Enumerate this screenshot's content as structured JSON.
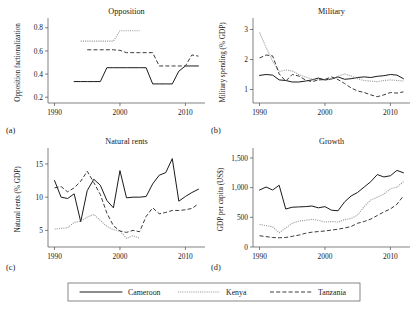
{
  "figure": {
    "background": "#ffffff",
    "series_colors": {
      "cameroon": "#1a1a1a",
      "kenya": "#9a9a9a",
      "tanzania": "#3a3a3a"
    },
    "panel_letters": {
      "a": "(a)",
      "b": "(b)",
      "c": "(c)",
      "d": "(d)"
    }
  },
  "legend": {
    "position": "bottom-center",
    "entries": [
      {
        "label": "Cameroon",
        "style": "solid",
        "color": "#1a1a1a"
      },
      {
        "label": "Kenya",
        "style": "dotted",
        "color": "#9a9a9a"
      },
      {
        "label": "Tanzania",
        "style": "dashed",
        "color": "#3a3a3a"
      }
    ]
  },
  "chart_data": [
    {
      "type": "line",
      "panel": "(a)",
      "title": "Opposition",
      "xlabel": "",
      "ylabel": "Opposition factionalization",
      "xlim": [
        1989,
        2013
      ],
      "ylim": [
        0.15,
        0.85
      ],
      "xticks": [
        1990,
        2000,
        2010
      ],
      "xticklabels": [
        "1990",
        "2000",
        "2010"
      ],
      "yticks": [
        0.2,
        0.4,
        0.6,
        0.8
      ],
      "yticklabels": [
        "0.2",
        "0.4",
        "0.6",
        "0.8"
      ],
      "grid": false,
      "x": [
        1990,
        1991,
        1992,
        1993,
        1994,
        1995,
        1996,
        1997,
        1998,
        1999,
        2000,
        2001,
        2002,
        2003,
        2004,
        2005,
        2006,
        2007,
        2008,
        2009,
        2010,
        2011,
        2012
      ],
      "series": [
        {
          "name": "Cameroon",
          "values": [
            null,
            null,
            null,
            0.335,
            0.335,
            0.335,
            0.335,
            0.335,
            0.455,
            0.455,
            0.455,
            0.455,
            0.455,
            0.455,
            0.455,
            0.315,
            0.315,
            0.315,
            0.315,
            0.425,
            0.47,
            0.47,
            0.47
          ]
        },
        {
          "name": "Kenya",
          "values": [
            null,
            null,
            null,
            null,
            0.685,
            0.685,
            0.685,
            0.685,
            0.685,
            0.685,
            0.775,
            0.775,
            0.775,
            0.775,
            null,
            null,
            null,
            null,
            null,
            null,
            null,
            null,
            null
          ]
        },
        {
          "name": "Tanzania",
          "values": [
            null,
            null,
            null,
            null,
            null,
            0.61,
            0.61,
            0.61,
            0.61,
            0.61,
            0.605,
            0.585,
            0.585,
            0.585,
            0.585,
            0.585,
            0.47,
            0.47,
            0.47,
            0.47,
            0.47,
            0.565,
            0.555
          ]
        }
      ]
    },
    {
      "type": "line",
      "panel": "(b)",
      "title": "Military",
      "xlabel": "",
      "ylabel": "Military spending (% GDP)",
      "xlim": [
        1989,
        2013
      ],
      "ylim": [
        0.55,
        3.25
      ],
      "xticks": [
        1990,
        2000,
        2010
      ],
      "xticklabels": [
        "1990",
        "2000",
        "2010"
      ],
      "yticks": [
        1,
        2,
        3
      ],
      "yticklabels": [
        "1",
        "2",
        "3"
      ],
      "grid": false,
      "x": [
        1990,
        1991,
        1992,
        1993,
        1994,
        1995,
        1996,
        1997,
        1998,
        1999,
        2000,
        2001,
        2002,
        2003,
        2004,
        2005,
        2006,
        2007,
        2008,
        2009,
        2010,
        2011,
        2012
      ],
      "series": [
        {
          "name": "Cameroon",
          "values": [
            1.47,
            1.5,
            1.48,
            1.32,
            1.3,
            1.25,
            1.25,
            1.28,
            1.32,
            1.38,
            1.32,
            1.35,
            1.42,
            1.34,
            1.36,
            1.4,
            1.42,
            1.4,
            1.44,
            1.46,
            1.5,
            1.48,
            1.36
          ]
        },
        {
          "name": "Kenya",
          "values": [
            2.9,
            2.4,
            1.95,
            1.6,
            1.65,
            1.62,
            1.5,
            1.42,
            1.35,
            1.32,
            1.3,
            1.36,
            1.44,
            1.52,
            1.45,
            1.36,
            1.3,
            1.28,
            1.26,
            1.3,
            1.32,
            1.3,
            1.28
          ]
        },
        {
          "name": "Tanzania",
          "values": [
            2.05,
            2.15,
            2.12,
            1.52,
            1.28,
            1.5,
            1.45,
            1.32,
            1.26,
            1.32,
            1.34,
            1.42,
            1.33,
            1.2,
            1.05,
            0.95,
            0.9,
            0.82,
            0.76,
            0.82,
            0.9,
            0.88,
            0.92
          ]
        }
      ]
    },
    {
      "type": "line",
      "panel": "(c)",
      "title": "Natural rents",
      "xlabel": "",
      "ylabel": "Natural rents (% GDP)",
      "xlim": [
        1989,
        2013
      ],
      "ylim": [
        2.5,
        16.8
      ],
      "xticks": [
        1990,
        2000,
        2010
      ],
      "xticklabels": [
        "1990",
        "2000",
        "2010"
      ],
      "yticks": [
        5,
        10,
        15
      ],
      "yticklabels": [
        "5",
        "10",
        "15"
      ],
      "grid": false,
      "x": [
        1990,
        1991,
        1992,
        1993,
        1994,
        1995,
        1996,
        1997,
        1998,
        1999,
        2000,
        2001,
        2002,
        2003,
        2004,
        2005,
        2006,
        2007,
        2008,
        2009,
        2010,
        2011,
        2012
      ],
      "series": [
        {
          "name": "Cameroon",
          "values": [
            12.5,
            10.0,
            9.8,
            10.5,
            6.3,
            11.0,
            12.7,
            11.8,
            9.5,
            8.4,
            14.0,
            9.9,
            10.0,
            10.0,
            10.1,
            12.0,
            13.3,
            13.7,
            15.8,
            9.4,
            10.1,
            10.7,
            11.2
          ]
        },
        {
          "name": "Kenya",
          "values": [
            5.2,
            5.3,
            5.4,
            6.2,
            6.4,
            7.0,
            7.4,
            6.5,
            5.6,
            5.1,
            4.9,
            3.8,
            4.2,
            3.8,
            null,
            null,
            null,
            null,
            null,
            null,
            null,
            null,
            null
          ]
        },
        {
          "name": "Tanzania",
          "values": [
            11.4,
            11.6,
            10.8,
            11.4,
            12.4,
            13.9,
            12.2,
            10.4,
            7.6,
            5.7,
            4.9,
            4.7,
            5.0,
            4.8,
            7.1,
            8.4,
            7.5,
            7.7,
            8.0,
            8.0,
            8.1,
            8.3,
            9.0
          ]
        }
      ]
    },
    {
      "type": "line",
      "panel": "(d)",
      "title": "Growth",
      "xlabel": "",
      "ylabel": "GDP per capita (US$)",
      "xlim": [
        1989,
        2013
      ],
      "ylim": [
        0,
        1600
      ],
      "xticks": [
        1990,
        2000,
        2010
      ],
      "xticklabels": [
        "1990",
        "2000",
        "2010"
      ],
      "yticks": [
        0,
        500,
        1000,
        1500
      ],
      "yticklabels": [
        "0",
        "500",
        "1,000",
        "1,500"
      ],
      "grid": false,
      "x": [
        1990,
        1991,
        1992,
        1993,
        1994,
        1995,
        1996,
        1997,
        1998,
        1999,
        2000,
        2001,
        2002,
        2003,
        2004,
        2005,
        2006,
        2007,
        2008,
        2009,
        2010,
        2011,
        2012
      ],
      "series": [
        {
          "name": "Cameroon",
          "values": [
            960,
            1010,
            960,
            1040,
            640,
            670,
            675,
            680,
            690,
            660,
            680,
            620,
            610,
            760,
            860,
            920,
            1010,
            1100,
            1220,
            1180,
            1200,
            1290,
            1250
          ]
        },
        {
          "name": "Kenya",
          "values": [
            380,
            360,
            340,
            240,
            320,
            400,
            435,
            450,
            465,
            450,
            420,
            430,
            420,
            460,
            480,
            540,
            680,
            790,
            840,
            890,
            980,
            1010,
            1100
          ]
        },
        {
          "name": "Tanzania",
          "values": [
            190,
            175,
            160,
            155,
            160,
            180,
            200,
            230,
            250,
            260,
            270,
            285,
            300,
            320,
            345,
            400,
            430,
            470,
            530,
            590,
            640,
            720,
            860
          ]
        }
      ]
    }
  ]
}
